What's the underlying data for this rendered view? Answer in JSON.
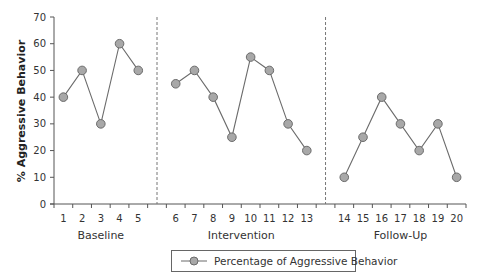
{
  "chart_data": {
    "type": "line",
    "title": "",
    "xlabel": "",
    "ylabel": "% Aggressive Behavior",
    "ylim": [
      0,
      70
    ],
    "yticks": [
      0,
      10,
      20,
      30,
      40,
      50,
      60,
      70
    ],
    "grid": false,
    "legend_position": "bottom-center",
    "phase_separator_style": "dashed-vertical",
    "phases": [
      {
        "name": "Baseline",
        "sessions": [
          1,
          2,
          3,
          4,
          5
        ],
        "values": [
          40,
          50,
          30,
          60,
          50
        ]
      },
      {
        "name": "Intervention",
        "sessions": [
          6,
          7,
          8,
          9,
          10,
          11,
          12,
          13
        ],
        "values": [
          45,
          50,
          40,
          25,
          55,
          50,
          30,
          20
        ]
      },
      {
        "name": "Follow-Up",
        "sessions": [
          14,
          15,
          16,
          17,
          18,
          19,
          20
        ],
        "values": [
          10,
          25,
          40,
          30,
          20,
          30,
          10
        ]
      }
    ],
    "series": [
      {
        "name": "Percentage of Aggressive Behavior",
        "x": [
          1,
          2,
          3,
          4,
          5,
          6,
          7,
          8,
          9,
          10,
          11,
          12,
          13,
          14,
          15,
          16,
          17,
          18,
          19,
          20
        ],
        "values": [
          40,
          50,
          30,
          60,
          50,
          45,
          50,
          40,
          25,
          55,
          50,
          30,
          20,
          10,
          25,
          40,
          30,
          20,
          30,
          10
        ]
      }
    ],
    "colors": {
      "line": "#6b6b6b",
      "marker_fill": "#a8a8a8",
      "marker_stroke": "#6b6b6b",
      "axis": "#555555",
      "separator": "#777777"
    }
  },
  "legend": {
    "label": "Percentage of Aggressive Behavior",
    "icon": "line-with-circle-marker-icon"
  }
}
